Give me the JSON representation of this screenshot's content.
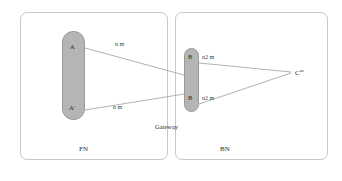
{
  "diagram": {
    "panels": [
      {
        "id": "FN",
        "label": "FN"
      },
      {
        "id": "BN",
        "label": "BN"
      }
    ],
    "gateway_label": "Gateway",
    "nodes": {
      "a": "A",
      "a_prime": "A'",
      "b": "B",
      "b_prime": "B",
      "c": "C",
      "c_superscript": "m"
    },
    "edge_labels": {
      "a_to_b": "n m",
      "aprime_to_bprime": "n m",
      "b_to_c": "n2 m",
      "bprime_to_c": "n2 m"
    },
    "colors": {
      "node_fill": "#b5b5b5",
      "node_stroke": "#9a9a9a",
      "panel_border": "#c9c9c9",
      "edge_line": "#8f8f8f",
      "text": "#2b2b2b"
    }
  }
}
